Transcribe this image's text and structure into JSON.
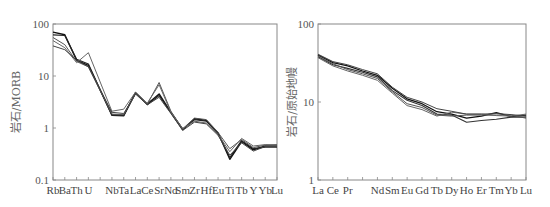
{
  "chart_data": [
    {
      "type": "line",
      "title": "",
      "xlabel": "",
      "ylabel": "岩石/MORB",
      "yscale": "log",
      "ylim": [
        0.1,
        100
      ],
      "yticks": [
        "100",
        "10",
        "1",
        "0.1"
      ],
      "grid": false,
      "legend": "none",
      "categories": [
        "Rb",
        "Ba",
        "Th",
        "U",
        "K",
        "Nb",
        "Ta",
        "La",
        "Ce",
        "Sr",
        "Nd",
        "Sm",
        "Zr",
        "Hf",
        "Eu",
        "Ti",
        "Tb",
        "Y",
        "Yb",
        "Lu"
      ],
      "category_labels_shown": [
        "Rb",
        "Ba",
        "Th",
        "U",
        "",
        "Nb",
        "Ta",
        "La",
        "Ce",
        "Sr",
        "Nd",
        "Sm",
        "Zr",
        "Hf",
        "Eu",
        "Ti",
        "Tb",
        "Y",
        "Yb",
        "Lu"
      ],
      "series": [
        {
          "name": "sample-1",
          "values": [
            70,
            62,
            20,
            16,
            null,
            1.8,
            1.75,
            4.7,
            2.9,
            4.5,
            2.0,
            0.95,
            1.5,
            1.4,
            0.8,
            0.25,
            0.55,
            0.38,
            0.45,
            0.45
          ],
          "stroke": "#111111",
          "width": 1.4
        },
        {
          "name": "sample-2",
          "values": [
            62,
            60,
            21,
            17,
            null,
            1.75,
            1.7,
            4.8,
            2.8,
            4.2,
            2.0,
            0.92,
            1.45,
            1.35,
            0.78,
            0.27,
            0.57,
            0.4,
            0.43,
            0.43
          ],
          "stroke": "#222222",
          "width": 1.2
        },
        {
          "name": "sample-3",
          "values": [
            55,
            40,
            19,
            15,
            null,
            1.85,
            1.8,
            4.6,
            2.9,
            7.5,
            2.1,
            0.95,
            1.55,
            1.45,
            0.82,
            0.4,
            0.6,
            0.42,
            0.47,
            0.48
          ],
          "stroke": "#555555",
          "width": 1.0
        },
        {
          "name": "sample-4",
          "values": [
            48,
            35,
            18,
            28,
            null,
            2.1,
            2.3,
            4.9,
            3.0,
            6.8,
            2.0,
            0.98,
            1.35,
            1.25,
            0.75,
            0.35,
            0.63,
            0.45,
            0.48,
            0.47
          ],
          "stroke": "#666666",
          "width": 1.0
        },
        {
          "name": "sample-5",
          "values": [
            38,
            32,
            20,
            15,
            null,
            2.0,
            1.9,
            4.5,
            2.8,
            3.9,
            1.9,
            0.9,
            1.3,
            1.2,
            0.72,
            0.3,
            0.52,
            0.36,
            0.44,
            0.44
          ],
          "stroke": "#444444",
          "width": 1.0
        }
      ]
    },
    {
      "type": "line",
      "title": "",
      "xlabel": "",
      "ylabel": "岩石/原始地幔",
      "yscale": "log",
      "ylim": [
        1,
        100
      ],
      "yticks": [
        "100",
        "10",
        "1"
      ],
      "grid": false,
      "legend": "none",
      "categories": [
        "La",
        "Ce",
        "Pr",
        "Pm",
        "Nd",
        "Sm",
        "Eu",
        "Gd",
        "Tb",
        "Dy",
        "Ho",
        "Er",
        "Tm",
        "Yb",
        "Lu"
      ],
      "category_labels_shown": [
        "La",
        "Ce",
        "Pr",
        "",
        "Nd",
        "Sm",
        "Eu",
        "Gd",
        "Tb",
        "Dy",
        "Ho",
        "Er",
        "Tm",
        "Yb",
        "Lu"
      ],
      "series": [
        {
          "name": "sample-1",
          "values": [
            40,
            32,
            29,
            25,
            22,
            15,
            11,
            9.5,
            7.5,
            7.0,
            6.2,
            6.6,
            7.3,
            6.5,
            6.8
          ],
          "stroke": "#111111",
          "width": 1.3
        },
        {
          "name": "sample-2",
          "values": [
            38,
            30,
            27,
            24,
            21,
            14,
            10.5,
            9.0,
            7.0,
            6.8,
            5.5,
            5.8,
            6.0,
            6.4,
            6.4
          ],
          "stroke": "#333333",
          "width": 1.1
        },
        {
          "name": "sample-3",
          "values": [
            39,
            31,
            26,
            23,
            20,
            13.5,
            9.5,
            8.5,
            6.8,
            6.6,
            6.8,
            6.8,
            6.8,
            6.8,
            6.2
          ],
          "stroke": "#555555",
          "width": 1.0
        },
        {
          "name": "sample-4",
          "values": [
            37,
            29,
            25,
            22,
            19,
            13,
            9.0,
            8.0,
            6.6,
            7.4,
            7.0,
            7.0,
            6.7,
            6.6,
            7.0
          ],
          "stroke": "#666666",
          "width": 1.0
        },
        {
          "name": "sample-5",
          "values": [
            41,
            33,
            30,
            26,
            23,
            15.5,
            11.5,
            10,
            8.2,
            7.6,
            7.0,
            7.0,
            7.1,
            6.9,
            6.6
          ],
          "stroke": "#444444",
          "width": 1.0
        }
      ]
    }
  ]
}
